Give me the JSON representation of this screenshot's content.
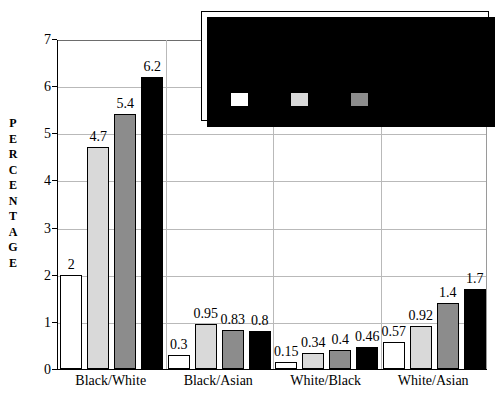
{
  "chart_data": {
    "type": "bar",
    "title": "INTERRACIAL MARRIAGES IN THE U.S.",
    "title_line1": "INTERRACIAL MARRIAGES",
    "title_line2": "IN THE U.S.",
    "subtitle": "(as a percentage of all the marriages within each race)",
    "xlabel": "",
    "ylabel": "PERCENTAGE",
    "ylim": [
      0,
      7
    ],
    "yticks": [
      "0",
      "1",
      "2",
      "3",
      "4",
      "5",
      "6",
      "7"
    ],
    "grid": true,
    "legend_position": "top-right-inset",
    "categories": [
      "Black/White",
      "Black/Asian",
      "White/Black",
      "White/Asian"
    ],
    "series": [
      {
        "name": "1970",
        "color": "#ffffff",
        "values": [
          2,
          0.3,
          0.15,
          0.57
        ],
        "labels": [
          "2",
          "0.3",
          "0.15",
          "0.57"
        ]
      },
      {
        "name": "1980",
        "color": "#d9d9d9",
        "values": [
          4.7,
          0.95,
          0.34,
          0.92
        ],
        "labels": [
          "4.7",
          "0.95",
          "0.34",
          "0.92"
        ]
      },
      {
        "name": "1990",
        "color": "#8c8c8c",
        "values": [
          5.4,
          0.83,
          0.4,
          1.4
        ],
        "labels": [
          "5.4",
          "0.83",
          "0.4",
          "1.4"
        ]
      },
      {
        "name": "1993",
        "color": "#000000",
        "values": [
          6.2,
          0.8,
          0.46,
          1.7
        ],
        "labels": [
          "6.2",
          "0.8",
          "0.46",
          "1.7"
        ]
      }
    ]
  },
  "axis": {
    "y_title_letters": [
      "P",
      "E",
      "R",
      "C",
      "E",
      "N",
      "T",
      "A",
      "G",
      "E"
    ]
  }
}
